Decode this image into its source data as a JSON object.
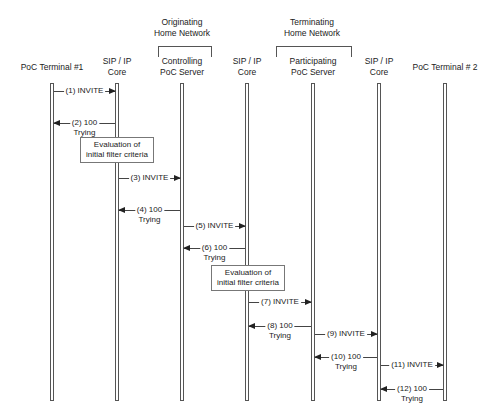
{
  "groups": [
    {
      "line1": "Originating",
      "line2": "Home Network"
    },
    {
      "line1": "Terminating",
      "line2": "Home Network"
    }
  ],
  "participants": [
    {
      "line1": "PoC Terminal #1",
      "line2": ""
    },
    {
      "line1": "SIP / IP",
      "line2": "Core"
    },
    {
      "line1": "Controlling",
      "line2": "PoC Server"
    },
    {
      "line1": "SIP / IP",
      "line2": "Core"
    },
    {
      "line1": "Participating",
      "line2": "PoC Server"
    },
    {
      "line1": "SIP / IP",
      "line2": "Core"
    },
    {
      "line1": "PoC Terminal # 2",
      "line2": ""
    }
  ],
  "messages": [
    {
      "line1": "(1) INVITE",
      "line2": ""
    },
    {
      "line1": "(2) 100",
      "line2": "Trying"
    },
    {
      "line1": "(3) INVITE",
      "line2": ""
    },
    {
      "line1": "(4) 100",
      "line2": "Trying"
    },
    {
      "line1": "(5) INVITE",
      "line2": ""
    },
    {
      "line1": "(6) 100",
      "line2": "Trying"
    },
    {
      "line1": "(7) INVITE",
      "line2": ""
    },
    {
      "line1": "(8) 100",
      "line2": "Trying"
    },
    {
      "line1": "(9) INVITE",
      "line2": ""
    },
    {
      "line1": "(10) 100",
      "line2": "Trying"
    },
    {
      "line1": "(11) INVITE",
      "line2": ""
    },
    {
      "line1": "(12) 100",
      "line2": "Trying"
    }
  ],
  "notes": [
    {
      "line1": "Evaluation of",
      "line2": "initial filter criteria"
    },
    {
      "line1": "Evaluation of",
      "line2": "initial filter criteria"
    }
  ]
}
